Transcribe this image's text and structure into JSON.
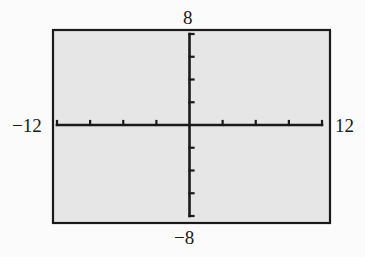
{
  "chart_data": {
    "type": "line",
    "title": "",
    "xlabel": "",
    "ylabel": "",
    "xlim": [
      -12,
      12
    ],
    "ylim": [
      -8,
      8
    ],
    "x_tick_step": 3,
    "y_tick_step": 2,
    "x_ticks": [
      -12,
      -9,
      -6,
      -3,
      0,
      3,
      6,
      9,
      12
    ],
    "y_ticks": [
      -8,
      -6,
      -4,
      -2,
      0,
      2,
      4,
      6,
      8
    ],
    "grid": false,
    "series": [],
    "window_labels": {
      "xmin": "−12",
      "xmax": "12",
      "ymin": "−8",
      "ymax": "8"
    }
  },
  "colors": {
    "page_background": "#fbfbfb",
    "screen_background": "#e6e6e6",
    "frame": "#1a1a1a",
    "axes": "#1a1a1a",
    "label_text": "#1a1a1a"
  },
  "layout": {
    "frame": {
      "left": 53,
      "top": 30,
      "right": 330,
      "bottom": 223
    },
    "plot": {
      "x0": 57,
      "x1": 322,
      "y0": 34,
      "y1": 216
    }
  }
}
